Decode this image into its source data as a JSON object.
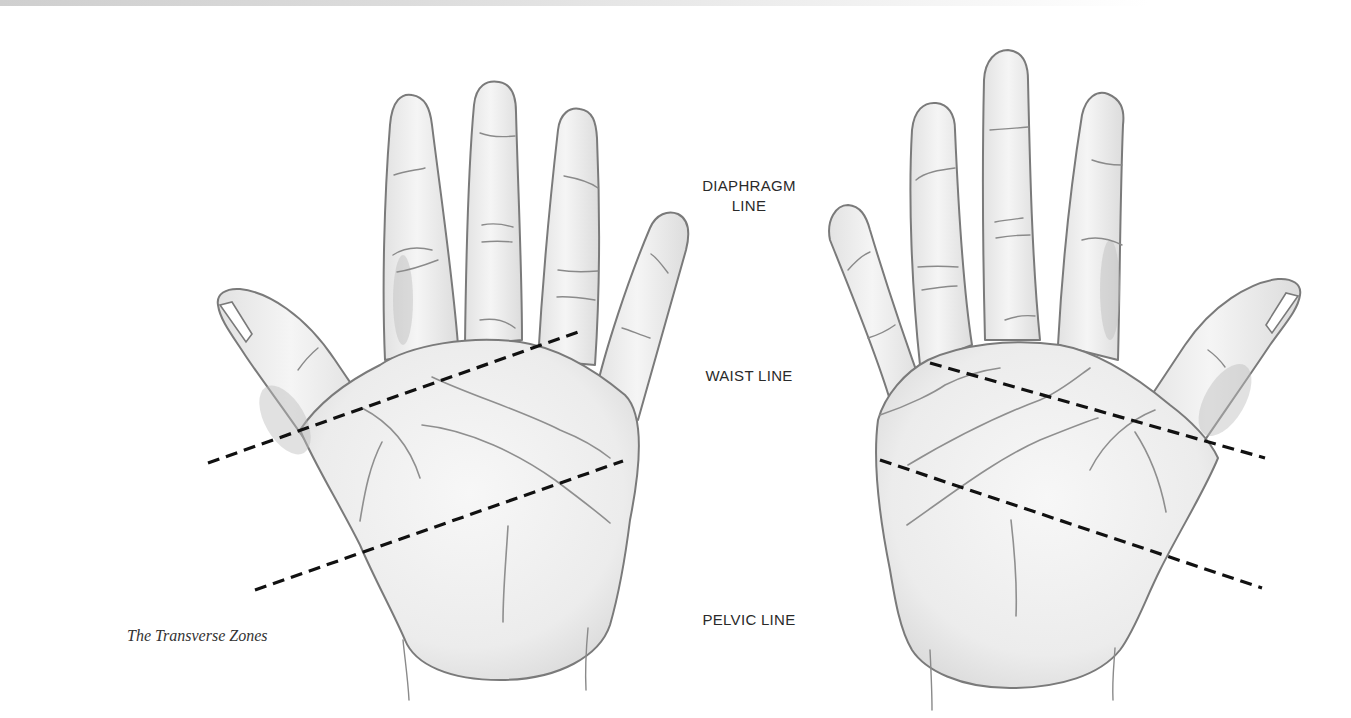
{
  "figure": {
    "caption": "The Transverse Zones",
    "zones": [
      {
        "id": "diaphragm",
        "label_line1": "DIAPHRAGM",
        "label_line2": "LINE"
      },
      {
        "id": "waist",
        "label": "WAIST LINE"
      },
      {
        "id": "pelvic",
        "label": "PELVIC LINE"
      }
    ],
    "hands": [
      {
        "id": "left-hand",
        "dashed_lines": [
          {
            "name": "waist-line",
            "x1": 208,
            "y1": 463,
            "x2": 578,
            "y2": 332
          },
          {
            "name": "pelvic-line",
            "x1": 255,
            "y1": 590,
            "x2": 623,
            "y2": 461
          }
        ]
      },
      {
        "id": "right-hand",
        "dashed_lines": [
          {
            "name": "waist-line",
            "x1": 930,
            "y1": 363,
            "x2": 1265,
            "y2": 458
          },
          {
            "name": "pelvic-line",
            "x1": 880,
            "y1": 460,
            "x2": 1262,
            "y2": 588
          }
        ]
      }
    ],
    "colors": {
      "outline": "#7a7a7a",
      "dash": "#111111",
      "label_text": "#2a2a2a",
      "background": "#ffffff"
    }
  }
}
